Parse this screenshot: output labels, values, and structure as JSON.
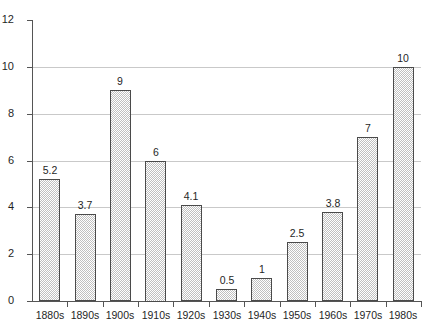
{
  "chart_data": {
    "type": "bar",
    "title": "",
    "subtitle": "",
    "xlabel": "",
    "ylabel": "",
    "categories": [
      "1880s",
      "1890s",
      "1900s",
      "1910s",
      "1920s",
      "1930s",
      "1940s",
      "1950s",
      "1960s",
      "1970s",
      "1980s"
    ],
    "values": [
      5.2,
      3.7,
      9,
      6,
      4.1,
      0.5,
      1,
      2.5,
      3.8,
      7,
      10
    ],
    "value_labels": [
      "5.2",
      "3.7",
      "9",
      "6",
      "4.1",
      "0.5",
      "1",
      "2.5",
      "3.8",
      "7",
      "10"
    ],
    "ylim": [
      0,
      12
    ],
    "y_ticks": [
      0,
      2,
      4,
      6,
      8,
      10,
      12
    ],
    "y_tick_labels": [
      "0",
      "2",
      "4",
      "6",
      "8",
      "10",
      "12"
    ],
    "gridlines": [
      2,
      4,
      6,
      8,
      10
    ],
    "grid": true,
    "legend": false,
    "legend_position": "none",
    "series_name": "",
    "bar_fill": "#c0c0c0",
    "bar_border": "#4a4a4a",
    "grid_color": "#c9c9c9",
    "axis_color": "#555555",
    "background": "#ffffff"
  }
}
